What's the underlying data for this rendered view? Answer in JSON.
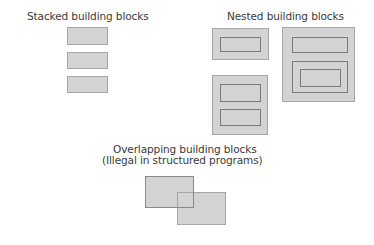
{
  "diagram": {
    "colors": {
      "background": "#ffffff",
      "block_fill": "#d3d3d3",
      "block_border": "#a6a6a6",
      "inner_border": "#7a7a7a",
      "text": "#3a3a3a"
    },
    "stacked": {
      "title": "Stacked building blocks",
      "blocks": 3
    },
    "nested": {
      "title": "Nested building blocks",
      "examples": [
        {
          "description": "one block nested inside another"
        },
        {
          "description": "two stacked blocks nested inside a block"
        },
        {
          "description": "a block and a doubly-nested block inside a block"
        }
      ]
    },
    "overlapping": {
      "title_line1": "Overlapping building blocks",
      "title_line2": "(Illegal in structured programs)",
      "blocks": 2
    }
  }
}
